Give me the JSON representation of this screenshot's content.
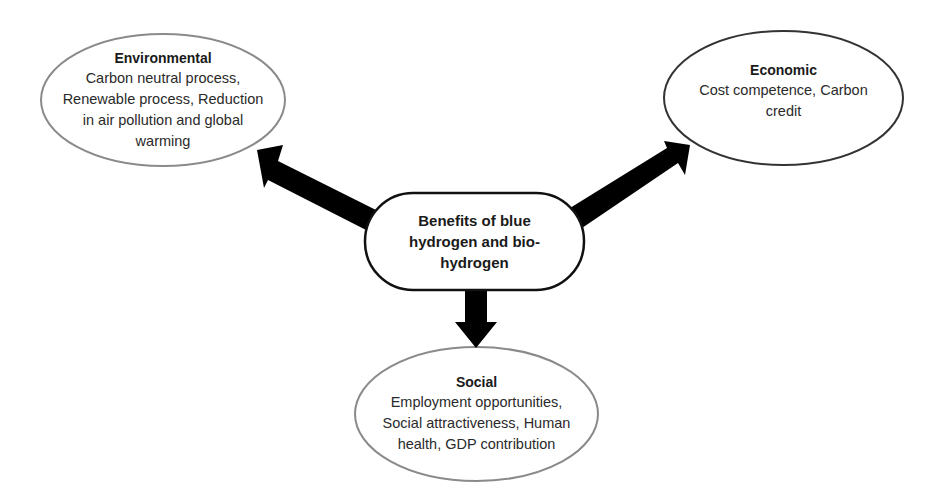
{
  "diagram": {
    "center": {
      "label": "Benefits of blue hydrogen and bio-hydrogen",
      "lines": [
        "Benefits of blue",
        "hydrogen and bio-",
        "hydrogen"
      ]
    },
    "nodes": {
      "environmental": {
        "title": "Environmental",
        "lines": [
          "Carbon neutral process,",
          "Renewable process, Reduction",
          "in air pollution and global",
          "warming"
        ]
      },
      "economic": {
        "title": "Economic",
        "lines": [
          "Cost competence, Carbon",
          "credit"
        ]
      },
      "social": {
        "title": "Social",
        "lines": [
          "Employment opportunities,",
          "Social attractiveness, Human",
          "health, GDP contribution"
        ]
      }
    },
    "edges": [
      {
        "from": "center",
        "to": "environmental"
      },
      {
        "from": "center",
        "to": "economic"
      },
      {
        "from": "center",
        "to": "social"
      }
    ],
    "colors": {
      "arrow": "#000000",
      "center_border": "#111111",
      "economic_border": "#333333",
      "ellipse_border_light": "#8a8a8a",
      "background": "#ffffff"
    }
  }
}
